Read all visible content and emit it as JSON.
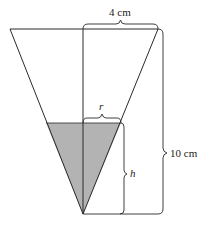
{
  "diagram": {
    "type": "inverted-cone-water-tank",
    "labels": {
      "top_radius": "4 cm",
      "height": "10 cm",
      "water_radius": "r",
      "water_height": "h"
    },
    "colors": {
      "line": "#2a2a2a",
      "water_fill": "#b3b3b3",
      "background": "#ffffff"
    }
  }
}
